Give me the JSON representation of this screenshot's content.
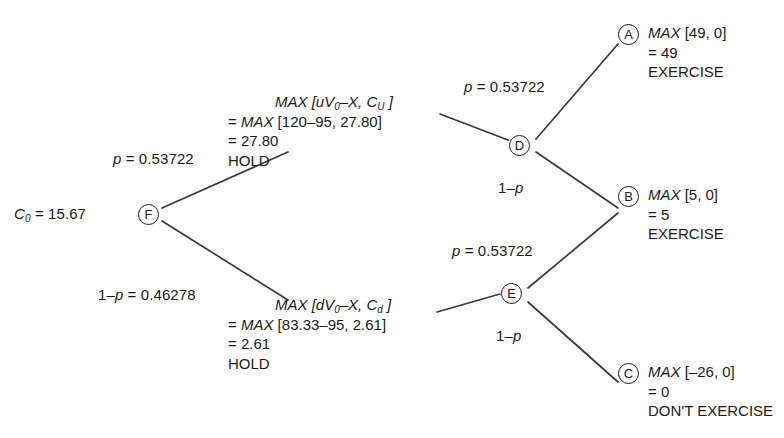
{
  "diagram": {
    "line_color": "#3a3a3a",
    "text_color": "#1a1a1a",
    "background": "#ffffff"
  },
  "root": {
    "value_label_pre": "C",
    "value_label_sub": "0",
    "value_label_post": " = 15.67",
    "node_letter": "F"
  },
  "branch_labels": {
    "root_up": "p = 0.53722",
    "root_down_pre": "1–p",
    "root_down_post": " = 0.46278",
    "d_up": "p = 0.53722",
    "d_down": "1–p",
    "e_up": "p = 0.53722",
    "e_down": "1–p"
  },
  "nodes": {
    "upper_mid": {
      "letter": "D",
      "line1_max": "MAX",
      "line1_rest_a": " [uV",
      "line1_rest_sub": "0",
      "line1_rest_b": "–X, C",
      "line1_rest_sub2": "U",
      "line1_rest_c": " ]",
      "line2_eq": "= ",
      "line2_max": "MAX",
      "line2_rest": " [120–95, 27.80]",
      "line3": "= 27.80",
      "line4": "HOLD"
    },
    "lower_mid": {
      "letter": "E",
      "line1_max": "MAX",
      "line1_rest_a": " [dV",
      "line1_rest_sub": "0",
      "line1_rest_b": "–X, C",
      "line1_rest_sub2": "d",
      "line1_rest_c": " ]",
      "line2_eq": "= ",
      "line2_max": "MAX",
      "line2_rest": " [83.33–95, 2.61]",
      "line3": "= 2.61",
      "line4": "HOLD"
    }
  },
  "terminals": [
    {
      "letter": "A",
      "max_word": "MAX",
      "payoff": " [49, 0]",
      "value": "= 49",
      "decision": "EXERCISE"
    },
    {
      "letter": "B",
      "max_word": "MAX",
      "payoff": " [5, 0]",
      "value": "= 5",
      "decision": "EXERCISE"
    },
    {
      "letter": "C",
      "max_word": "MAX",
      "payoff": " [–26, 0]",
      "value": "= 0",
      "decision": "DON'T EXERCISE"
    }
  ]
}
